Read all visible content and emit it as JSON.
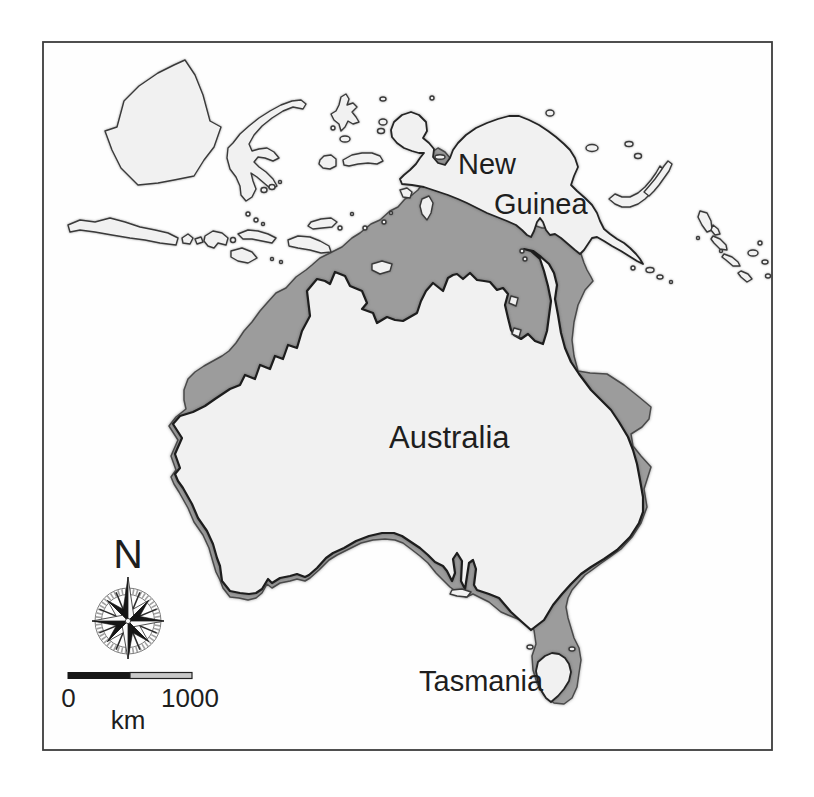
{
  "map": {
    "labels": {
      "new_guinea_line1": "New",
      "new_guinea_line2": "Guinea",
      "australia": "Australia",
      "tasmania": "Tasmania"
    },
    "compass": {
      "north_label": "N"
    },
    "scale_bar": {
      "start_label": "0",
      "end_label": "1000",
      "unit_label": "km"
    },
    "colors": {
      "land_fill": "#f1f1f1",
      "continental_shelf_fill": "#9c9c9c",
      "coastline": "#1d1d1d",
      "frame": "#3c3c3c",
      "background": "#ffffff"
    }
  }
}
